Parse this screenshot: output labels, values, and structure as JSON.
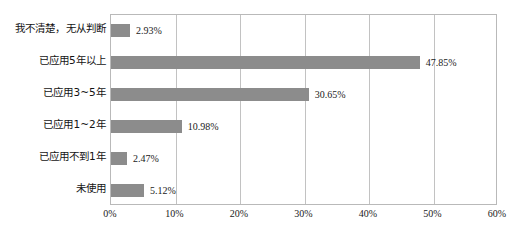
{
  "chart_data": {
    "type": "bar",
    "orientation": "horizontal",
    "title": "",
    "subtitle": "",
    "xlabel": "",
    "ylabel": "",
    "xlim": [
      0,
      60
    ],
    "ylim": null,
    "grid": true,
    "legend": null,
    "legend_position": "none",
    "bar_color": "#8c8c8c",
    "axis_color": "#b9b9b9",
    "gridline_color": "#c2c2c2",
    "value_suffix": "%",
    "categories": [
      "我不清楚，无从判断",
      "已应用5年以上",
      "已应用3~5年",
      "已应用1~2年",
      "已应用不到1年",
      "未使用"
    ],
    "values": [
      2.93,
      47.85,
      30.65,
      10.98,
      2.47,
      5.12
    ],
    "value_labels": [
      "2.93%",
      "47.85%",
      "30.65%",
      "10.98%",
      "2.47%",
      "5.12%"
    ],
    "xticks": [
      0,
      10,
      20,
      30,
      40,
      50,
      60
    ],
    "xtick_labels": [
      "0%",
      "10%",
      "20%",
      "30%",
      "40%",
      "50%",
      "60%"
    ]
  },
  "caption": ""
}
